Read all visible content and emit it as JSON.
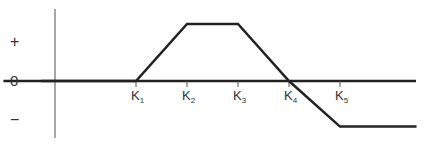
{
  "chart_data": {
    "type": "line",
    "title": "",
    "xlabel": "",
    "ylabel": "",
    "y_tick_labels": [
      "+",
      "0",
      "−"
    ],
    "x_tick_labels": [
      {
        "base": "K",
        "sub": "1"
      },
      {
        "base": "K",
        "sub": "2"
      },
      {
        "base": "K",
        "sub": "3"
      },
      {
        "base": "K",
        "sub": "4"
      },
      {
        "base": "K",
        "sub": "5"
      }
    ],
    "series": [
      {
        "name": "payoff",
        "points": [
          {
            "x": -1.6,
            "y": 0
          },
          {
            "x": 1,
            "y": 0
          },
          {
            "x": 2,
            "y": 1
          },
          {
            "x": 3,
            "y": 1
          },
          {
            "x": 4,
            "y": 0
          },
          {
            "x": 5,
            "y": -0.8
          },
          {
            "x": 6.5,
            "y": -0.8
          }
        ]
      }
    ],
    "xlim": [
      -1.9,
      6.6
    ],
    "ylim": [
      -1.0,
      1.0
    ],
    "grid": false,
    "legend": "none"
  }
}
